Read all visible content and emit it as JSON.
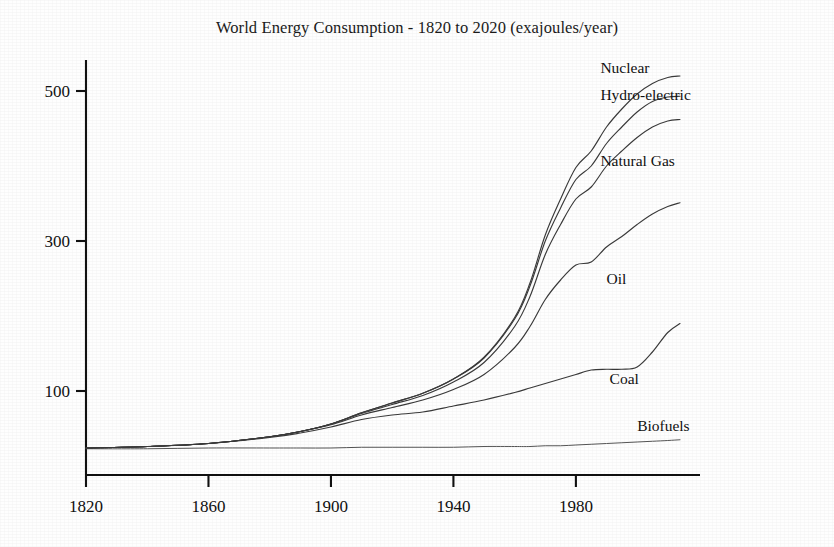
{
  "chart_data": {
    "type": "line",
    "title": "World Energy Consumption - 1820 to 2020 (exajoules/year)",
    "xlabel": "",
    "ylabel": "",
    "xlim": [
      1820,
      2014
    ],
    "ylim": [
      0,
      560
    ],
    "grid": false,
    "legend_position": "right-inline-labels",
    "stacked": true,
    "note": "Cumulative (stacked) curves; topmost curve is the total of all sources.",
    "xticks": [
      1820,
      1860,
      1900,
      1940,
      1980
    ],
    "xticklabels": [
      "1820",
      "1860",
      "1900",
      "1940",
      "1980"
    ],
    "yticks": [
      100,
      300,
      500
    ],
    "yticklabels": [
      "100",
      "300",
      "500"
    ],
    "x": [
      1820,
      1840,
      1860,
      1880,
      1890,
      1900,
      1910,
      1920,
      1930,
      1940,
      1950,
      1960,
      1965,
      1970,
      1975,
      1980,
      1985,
      1990,
      1995,
      2000,
      2005,
      2010,
      2014
    ],
    "series": [
      {
        "name": "Biofuels",
        "label": "Biofuels",
        "label_x": 2000,
        "label_y": 47,
        "values": [
          23,
          23,
          24,
          24,
          24,
          24,
          25,
          25,
          25,
          25,
          26,
          26,
          26,
          27,
          27,
          28,
          29,
          30,
          31,
          32,
          33,
          34,
          35
        ]
      },
      {
        "name": "Coal",
        "label": "Coal",
        "label_x": 1991,
        "label_y": 110,
        "values": [
          24,
          26,
          30,
          38,
          44,
          52,
          62,
          68,
          72,
          80,
          88,
          98,
          104,
          110,
          116,
          122,
          128,
          129,
          129,
          132,
          152,
          178,
          190
        ]
      },
      {
        "name": "Oil",
        "label": "Oil",
        "label_x": 1990,
        "label_y": 243,
        "values": [
          24,
          26,
          30,
          39,
          46,
          55,
          68,
          78,
          88,
          102,
          122,
          158,
          186,
          222,
          248,
          268,
          272,
          292,
          306,
          322,
          336,
          346,
          351
        ]
      },
      {
        "name": "Natural Gas",
        "label": "Natural Gas",
        "label_x": 1988,
        "label_y": 400,
        "values": [
          24,
          26,
          30,
          39,
          46,
          56,
          70,
          82,
          94,
          112,
          138,
          186,
          226,
          282,
          322,
          356,
          372,
          400,
          420,
          438,
          452,
          460,
          462
        ]
      },
      {
        "name": "Hydro-electric",
        "label": "Hydro-electric",
        "label_x": 1988,
        "label_y": 488,
        "values": [
          24,
          26,
          30,
          39,
          46,
          56,
          71,
          84,
          97,
          116,
          144,
          196,
          240,
          300,
          344,
          382,
          400,
          430,
          452,
          472,
          486,
          492,
          493
        ]
      },
      {
        "name": "Nuclear",
        "label": "Nuclear",
        "label_x": 1988,
        "label_y": 524,
        "values": [
          24,
          26,
          30,
          39,
          46,
          56,
          71,
          84,
          97,
          116,
          145,
          198,
          244,
          308,
          356,
          398,
          420,
          452,
          476,
          496,
          510,
          518,
          520
        ]
      }
    ]
  },
  "axes": {
    "y_tick_500": "500",
    "y_tick_300": "300",
    "y_tick_100": "100",
    "x_tick_1820": "1820",
    "x_tick_1860": "1860",
    "x_tick_1900": "1900",
    "x_tick_1940": "1940",
    "x_tick_1980": "1980"
  },
  "colors": {
    "ink": "#111111",
    "curve": "#3a3a3a",
    "paper": "#fefefe"
  }
}
